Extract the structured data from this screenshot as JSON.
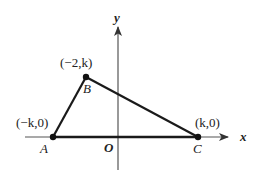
{
  "diagram": {
    "type": "coordinate-geometry",
    "colors": {
      "axis": "#555555",
      "triangle": "#1a1a1a",
      "text": "#222222",
      "background": "#ffffff"
    },
    "axes": {
      "x_label": "x",
      "y_label": "y",
      "origin_label": "O"
    },
    "points": [
      {
        "name": "A",
        "coord_label": "(−k,0)",
        "px": [
          53,
          137
        ]
      },
      {
        "name": "B",
        "coord_label": "(−2,k)",
        "px": [
          86,
          77
        ]
      },
      {
        "name": "C",
        "coord_label": "(k,0)",
        "px": [
          198,
          137
        ]
      }
    ],
    "segments": [
      [
        "A",
        "B"
      ],
      [
        "B",
        "C"
      ],
      [
        "A",
        "C"
      ]
    ]
  }
}
